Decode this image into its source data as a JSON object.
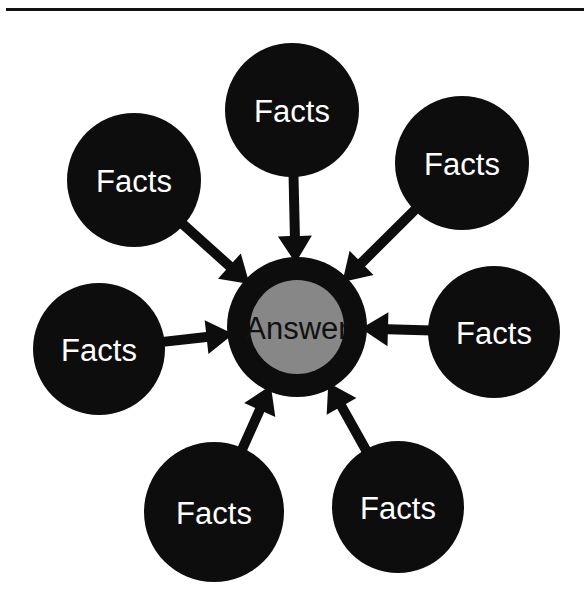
{
  "figure": {
    "type": "hub-and-spoke-diagram",
    "background_color": "#ffffff",
    "rule": {
      "visible": true,
      "color": "#111111"
    }
  },
  "hub": {
    "label": "Answer",
    "ring_color": "#0d0d0d",
    "core_color": "#878787",
    "label_color": "#111111",
    "cx": 297,
    "cy": 327,
    "outer_r": 70,
    "inner_r": 47
  },
  "arrow_color": "#0d0d0d",
  "nodes": [
    {
      "id": "node-top",
      "label": "Facts",
      "cx": 292,
      "cy": 110,
      "r": 67,
      "fill": "#0d0d0d",
      "label_color": "#ffffff"
    },
    {
      "id": "node-top-right",
      "label": "Facts",
      "cx": 462,
      "cy": 163,
      "r": 67,
      "fill": "#0d0d0d",
      "label_color": "#ffffff"
    },
    {
      "id": "node-right",
      "label": "Facts",
      "cx": 494,
      "cy": 332,
      "r": 66,
      "fill": "#0d0d0d",
      "label_color": "#ffffff"
    },
    {
      "id": "node-bottom-right",
      "label": "Facts",
      "cx": 398,
      "cy": 507,
      "r": 66,
      "fill": "#0d0d0d",
      "label_color": "#ffffff"
    },
    {
      "id": "node-bottom-left",
      "label": "Facts",
      "cx": 214,
      "cy": 512,
      "r": 70,
      "fill": "#0d0d0d",
      "label_color": "#ffffff"
    },
    {
      "id": "node-left",
      "label": "Facts",
      "cx": 99,
      "cy": 349,
      "r": 66,
      "fill": "#0d0d0d",
      "label_color": "#ffffff"
    },
    {
      "id": "node-top-left",
      "label": "Facts",
      "cx": 134,
      "cy": 180,
      "r": 67,
      "fill": "#0d0d0d",
      "label_color": "#ffffff"
    }
  ],
  "arrows": [
    {
      "id": "arrow-from-top",
      "from": "node-top",
      "to": "hub"
    },
    {
      "id": "arrow-from-top-right",
      "from": "node-top-right",
      "to": "hub"
    },
    {
      "id": "arrow-from-right",
      "from": "node-right",
      "to": "hub"
    },
    {
      "id": "arrow-from-bottom-right",
      "from": "node-bottom-right",
      "to": "hub"
    },
    {
      "id": "arrow-from-bottom-left",
      "from": "node-bottom-left",
      "to": "hub"
    },
    {
      "id": "arrow-from-left",
      "from": "node-left",
      "to": "hub"
    },
    {
      "id": "arrow-from-top-left",
      "from": "node-top-left",
      "to": "hub"
    }
  ]
}
